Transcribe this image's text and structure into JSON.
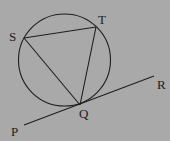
{
  "figure": {
    "background_color": "#a9a9a9",
    "stroke_color": "#1e1e1e",
    "circle": {
      "cx": 64.5,
      "cy": 60,
      "r": 46
    },
    "points": {
      "S": {
        "x": 24,
        "y": 38,
        "label": "S",
        "label_x": 9,
        "label_y": 41
      },
      "T": {
        "x": 96,
        "y": 27,
        "label": "T",
        "label_x": 98,
        "label_y": 24
      },
      "Q": {
        "x": 80,
        "y": 105,
        "label": "Q",
        "label_x": 79,
        "label_y": 118
      },
      "P": {
        "x": 24,
        "y": 125,
        "label": "P",
        "label_x": 11,
        "label_y": 136
      },
      "R": {
        "x": 154,
        "y": 76,
        "label": "R",
        "label_x": 157,
        "label_y": 89
      }
    },
    "segments": [
      {
        "from": "S",
        "to": "T"
      },
      {
        "from": "S",
        "to": "Q"
      },
      {
        "from": "T",
        "to": "Q"
      }
    ],
    "tangent_line": {
      "from": "P",
      "to": "R",
      "through": "Q"
    }
  }
}
